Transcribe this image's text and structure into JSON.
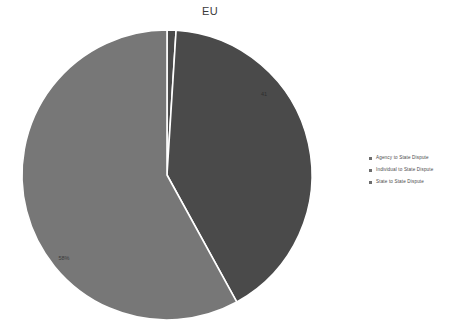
{
  "chart_data": {
    "type": "pie",
    "title": "EU",
    "categories": [
      "Agency to State Dispute",
      "Individual to State Dispute",
      "State to State Dispute"
    ],
    "values": [
      1,
      41,
      58
    ],
    "labels": [
      "",
      "41",
      "58%"
    ],
    "colors": [
      "#4a4a4a",
      "#4a4a4a",
      "#777777"
    ],
    "legend_position": "right",
    "grid": false,
    "xlabel": "",
    "ylabel": ""
  },
  "legend": {
    "items": [
      {
        "label": "Agency to State Dispute",
        "color": "#6d6d6d"
      },
      {
        "label": "Individual to State Dispute",
        "color": "#6d6d6d"
      },
      {
        "label": "State to State Dispute",
        "color": "#6d6d6d"
      }
    ]
  },
  "pie_geometry": {
    "cx": 167,
    "cy": 175,
    "r": 145,
    "start_angle_deg": -90,
    "stroke": "#ffffff",
    "stroke_width": 1.6
  },
  "slice_label_positions": [
    {
      "x": 170,
      "y": 44
    },
    {
      "x": 264,
      "y": 96
    },
    {
      "x": 64,
      "y": 260
    }
  ]
}
